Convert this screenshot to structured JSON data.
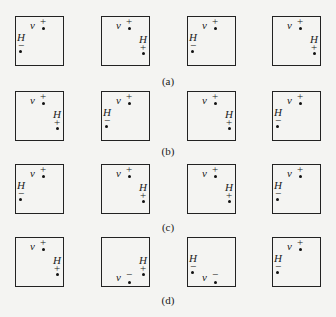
{
  "symbols": {
    "v": "v",
    "H": "H",
    "plus": "+",
    "minus": "−"
  },
  "rows": [
    {
      "caption": "(a)",
      "top": 16,
      "captionTop": 76,
      "boxes": [
        {
          "v": {
            "pos": "top",
            "sign": "+"
          },
          "H": {
            "pos": "left",
            "sign": "−"
          }
        },
        {
          "v": {
            "pos": "top",
            "sign": "+"
          },
          "H": {
            "pos": "right",
            "sign": "+"
          }
        },
        {
          "v": {
            "pos": "top",
            "sign": "+"
          },
          "H": {
            "pos": "left",
            "sign": "−"
          }
        },
        {
          "v": {
            "pos": "top",
            "sign": "+"
          },
          "H": {
            "pos": "right",
            "sign": "+"
          }
        }
      ]
    },
    {
      "caption": "(b)",
      "top": 91,
      "captionTop": 146,
      "boxes": [
        {
          "v": {
            "pos": "top",
            "sign": "+"
          },
          "H": {
            "pos": "right",
            "sign": "+"
          }
        },
        {
          "v": {
            "pos": "top",
            "sign": "+"
          },
          "H": {
            "pos": "left",
            "sign": "−"
          }
        },
        {
          "v": {
            "pos": "top",
            "sign": "+"
          },
          "H": {
            "pos": "right",
            "sign": "+"
          }
        },
        {
          "v": {
            "pos": "top",
            "sign": "+"
          },
          "H": {
            "pos": "left",
            "sign": "−"
          }
        }
      ]
    },
    {
      "caption": "(c)",
      "top": 164,
      "captionTop": 222,
      "boxes": [
        {
          "v": {
            "pos": "top",
            "sign": "+"
          },
          "H": {
            "pos": "left",
            "sign": "−"
          }
        },
        {
          "v": {
            "pos": "top",
            "sign": "+"
          },
          "H": {
            "pos": "right",
            "sign": "+"
          }
        },
        {
          "v": {
            "pos": "top",
            "sign": "+"
          },
          "H": {
            "pos": "right",
            "sign": "+"
          }
        },
        {
          "v": {
            "pos": "top",
            "sign": "+"
          },
          "H": {
            "pos": "left",
            "sign": "−"
          }
        }
      ]
    },
    {
      "caption": "(d)",
      "top": 237,
      "captionTop": 295,
      "boxes": [
        {
          "v": {
            "pos": "top",
            "sign": "+"
          },
          "H": {
            "pos": "right",
            "sign": "+"
          }
        },
        {
          "v": {
            "pos": "bottom",
            "sign": "−"
          },
          "H": {
            "pos": "right",
            "sign": "+"
          }
        },
        {
          "v": {
            "pos": "bottom",
            "sign": "−"
          },
          "H": {
            "pos": "left",
            "sign": "−"
          }
        },
        {
          "v": {
            "pos": "top",
            "sign": "+"
          },
          "H": {
            "pos": "left",
            "sign": "−"
          }
        }
      ]
    }
  ],
  "columns": [
    15,
    101,
    187,
    272
  ]
}
